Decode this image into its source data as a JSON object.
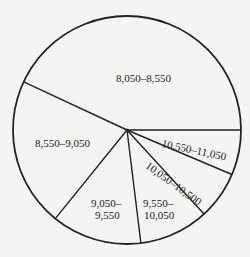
{
  "chart_data": {
    "type": "pie",
    "title": "",
    "center": [
      127,
      130
    ],
    "radius": 114,
    "start_angle_deg": 0,
    "direction": "counterclockwise",
    "colors": {
      "fill": "#f4f4f2",
      "stroke": "#222222"
    },
    "slices": [
      {
        "label": "8,050–8,550",
        "percent": 43,
        "degrees": 155
      },
      {
        "label": "8,550–9,050",
        "percent": 21,
        "degrees": 76
      },
      {
        "label": "9,050–9,550",
        "percent": 13,
        "degrees": 46
      },
      {
        "label": "9,550–10,050",
        "percent": 10,
        "degrees": 35.5
      },
      {
        "label": "10,050–10,500",
        "percent": 7,
        "degrees": 24.5
      },
      {
        "label": "10,550–11,050",
        "percent": 6,
        "degrees": 23
      }
    ]
  },
  "labels": {
    "s1": "8,050–8,550",
    "s2": "8,550–9,050",
    "s3a": "9,050–",
    "s3b": "9,550",
    "s4a": "9,550–",
    "s4b": "10,050",
    "s5": "10,050–10,500",
    "s6": "10,550–11,050"
  }
}
